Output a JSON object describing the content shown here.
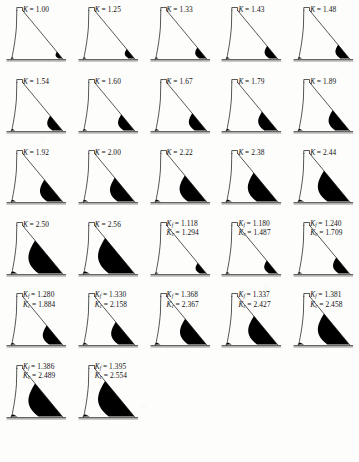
{
  "figure": {
    "caption": "",
    "caption_visible": false,
    "columns": 5,
    "rows": 6,
    "panel_count": 27,
    "ink_color": "#000000",
    "paper_color": "#fdfdfc"
  },
  "chart_data": {
    "type": "diagram-grid",
    "xlabel": "",
    "ylabel": "",
    "grid": {
      "columns": 5,
      "rows": 6
    },
    "legend": [],
    "series": [
      {
        "name": "load factor K",
        "label_symbol": "K",
        "values": [
          1.0,
          1.25,
          1.33,
          1.43,
          1.48,
          1.54,
          1.6,
          1.67,
          1.79,
          1.89,
          1.92,
          2.0,
          2.22,
          2.38,
          2.44,
          2.5,
          2.56
        ]
      },
      {
        "name": "Kf",
        "label_symbol": "Kf",
        "values": [
          1.118,
          1.18,
          1.24,
          1.28,
          1.33,
          1.368,
          1.337,
          1.381,
          1.386,
          1.395
        ]
      },
      {
        "name": "Kc",
        "label_symbol": "Kc",
        "values": [
          1.294,
          1.487,
          1.709,
          1.884,
          2.158,
          2.367,
          2.427,
          2.458,
          2.489,
          2.554
        ]
      }
    ],
    "panels": [
      {
        "index": 1,
        "type": "single",
        "symbol": "K",
        "value": "1.00",
        "crack": 0.06
      },
      {
        "index": 2,
        "type": "single",
        "symbol": "K",
        "value": "1.25",
        "crack": 0.13
      },
      {
        "index": 3,
        "type": "single",
        "symbol": "K",
        "value": "1.33",
        "crack": 0.17
      },
      {
        "index": 4,
        "type": "single",
        "symbol": "K",
        "value": "1.43",
        "crack": 0.21
      },
      {
        "index": 5,
        "type": "single",
        "symbol": "K",
        "value": "1.48",
        "crack": 0.24
      },
      {
        "index": 6,
        "type": "single",
        "symbol": "K",
        "value": "1.54",
        "crack": 0.27
      },
      {
        "index": 7,
        "type": "single",
        "symbol": "K",
        "value": "1.60",
        "crack": 0.3
      },
      {
        "index": 8,
        "type": "single",
        "symbol": "K",
        "value": "1.67",
        "crack": 0.33
      },
      {
        "index": 9,
        "type": "single",
        "symbol": "K",
        "value": "1.79",
        "crack": 0.37
      },
      {
        "index": 10,
        "type": "single",
        "symbol": "K",
        "value": "1.89",
        "crack": 0.41
      },
      {
        "index": 11,
        "type": "single",
        "symbol": "K",
        "value": "1.92",
        "crack": 0.45
      },
      {
        "index": 12,
        "type": "single",
        "symbol": "K",
        "value": "2.00",
        "crack": 0.5
      },
      {
        "index": 13,
        "type": "single",
        "symbol": "K",
        "value": "2.22",
        "crack": 0.56
      },
      {
        "index": 14,
        "type": "single",
        "symbol": "K",
        "value": "2.38",
        "crack": 0.63
      },
      {
        "index": 15,
        "type": "single",
        "symbol": "K",
        "value": "2.44",
        "crack": 0.68
      },
      {
        "index": 16,
        "type": "single",
        "symbol": "K",
        "value": "2.50",
        "crack": 0.74
      },
      {
        "index": 17,
        "type": "single",
        "symbol": "K",
        "value": "2.56",
        "crack": 0.8
      },
      {
        "index": 18,
        "type": "pair",
        "symbol_f": "K",
        "sub_f": "f",
        "value_f": "1.118",
        "symbol_c": "K",
        "sub_c": "c",
        "value_c": "1.294",
        "crack": 0.16
      },
      {
        "index": 19,
        "type": "pair",
        "symbol_f": "K",
        "sub_f": "f",
        "value_f": "1.180",
        "symbol_c": "K",
        "sub_c": "c",
        "value_c": "1.487",
        "crack": 0.22
      },
      {
        "index": 20,
        "type": "pair",
        "symbol_f": "K",
        "sub_f": "f",
        "value_f": "1.240",
        "symbol_c": "K",
        "sub_c": "c",
        "value_c": "1.709",
        "crack": 0.3
      },
      {
        "index": 21,
        "type": "pair",
        "symbol_f": "K",
        "sub_f": "f",
        "value_f": "1.280",
        "symbol_c": "K",
        "sub_c": "c",
        "value_c": "1.884",
        "crack": 0.38
      },
      {
        "index": 22,
        "type": "pair",
        "symbol_f": "K",
        "sub_f": "f",
        "value_f": "1.330",
        "symbol_c": "K",
        "sub_c": "c",
        "value_c": "2.158",
        "crack": 0.47
      },
      {
        "index": 23,
        "type": "pair",
        "symbol_f": "K",
        "sub_f": "f",
        "value_f": "1.368",
        "symbol_c": "K",
        "sub_c": "c",
        "value_c": "2.367",
        "crack": 0.55
      },
      {
        "index": 24,
        "type": "pair",
        "symbol_f": "K",
        "sub_f": "f",
        "value_f": "1.337",
        "symbol_c": "K",
        "sub_c": "c",
        "value_c": "2.427",
        "crack": 0.62
      },
      {
        "index": 25,
        "type": "pair",
        "symbol_f": "K",
        "sub_f": "f",
        "value_f": "1.381",
        "symbol_c": "K",
        "sub_c": "c",
        "value_c": "2.458",
        "crack": 0.68
      },
      {
        "index": 26,
        "type": "pair",
        "symbol_f": "K",
        "sub_f": "f",
        "value_f": "1.386",
        "symbol_c": "K",
        "sub_c": "c",
        "value_c": "2.489",
        "crack": 0.74
      },
      {
        "index": 27,
        "type": "pair",
        "symbol_f": "K",
        "sub_f": "f",
        "value_f": "1.395",
        "symbol_c": "K",
        "sub_c": "c",
        "value_c": "2.554",
        "crack": 0.8
      }
    ]
  }
}
